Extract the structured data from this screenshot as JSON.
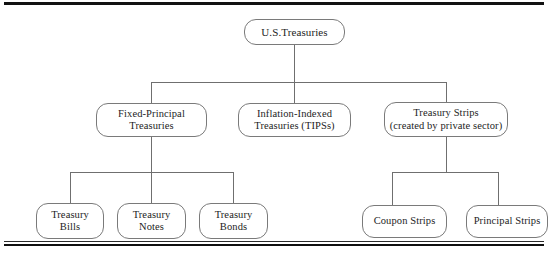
{
  "figure": {
    "type": "hierarchy-tree",
    "title_rule_top": "horizontal-rule",
    "title_rule_bottom": "double-horizontal-rule",
    "orientation": "top-down",
    "levels": 3
  },
  "nodes": {
    "root": {
      "id": "us-treasuries",
      "label": "U.S.Treasuries"
    },
    "level2": [
      {
        "id": "fixed-principal-treasuries",
        "label": "Fixed-Principal\nTreasuries"
      },
      {
        "id": "inflation-indexed-treasuries",
        "label": "Inflation-Indexed\nTreasuries (TIPSs)"
      },
      {
        "id": "treasury-strips",
        "label": "Treasury Strips\n(created by private sector)"
      }
    ],
    "level3_left": [
      {
        "id": "treasury-bills",
        "label": "Treasury\nBills"
      },
      {
        "id": "treasury-notes",
        "label": "Treasury\nNotes"
      },
      {
        "id": "treasury-bonds",
        "label": "Treasury\nBonds"
      }
    ],
    "level3_right": [
      {
        "id": "coupon-strips",
        "label": "Coupon Strips"
      },
      {
        "id": "principal-strips",
        "label": "Principal Strips"
      }
    ]
  },
  "colors": {
    "background": "#ffffff",
    "box_border": "#7a7a7a",
    "connector": "#6f6f6f",
    "rule": "#111111",
    "text": "#1d1d1d"
  }
}
